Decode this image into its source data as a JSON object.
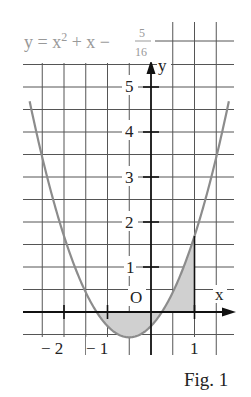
{
  "figure": {
    "equation": {
      "lhs": "y = x",
      "exponent": "2",
      "rhs": " + x −",
      "frac_num": "5",
      "frac_den": "16"
    },
    "caption": "Fig. 1",
    "axis_labels": {
      "x": "x",
      "y": "y",
      "origin": "O"
    },
    "x_ticks": [
      {
        "value": -2,
        "label": "− 2"
      },
      {
        "value": -1,
        "label": "− 1"
      },
      {
        "value": 1,
        "label": "1"
      }
    ],
    "y_ticks": [
      {
        "value": 1,
        "label": "1"
      },
      {
        "value": 2,
        "label": "2"
      },
      {
        "value": 3,
        "label": "3"
      },
      {
        "value": 4,
        "label": "4"
      },
      {
        "value": 5,
        "label": "5"
      }
    ],
    "colors": {
      "curve": "#8c8c8c",
      "grid": "#555555",
      "axis": "#111111",
      "shade": "#d0d0d0",
      "equation_text": "#999999",
      "text": "#222222"
    }
  },
  "chart_data": {
    "type": "line",
    "function": "y = x^2 + x - 5/16",
    "xlabel": "x",
    "ylabel": "y",
    "xlim": [
      -2.9,
      1.9
    ],
    "ylim": [
      -0.5,
      5.5
    ],
    "grid": true,
    "grid_step": 0.5,
    "roots": [
      -1.25,
      0.25
    ],
    "vertex": [
      -0.5,
      -0.5625
    ],
    "shaded_regions": [
      {
        "from_x": -1.25,
        "to_x": 0.25,
        "between": "curve and x-axis (below axis)"
      },
      {
        "from_x": 0.25,
        "to_x": 1,
        "between": "curve and x-axis (above axis)"
      }
    ],
    "x": [
      -2.75,
      -2.5,
      -2,
      -1.5,
      -1.25,
      -1,
      -0.5,
      0,
      0.25,
      0.5,
      1,
      1.5,
      1.75
    ],
    "values": [
      4.5,
      3.4375,
      1.6875,
      0.4375,
      0,
      -0.3125,
      -0.5625,
      -0.3125,
      0,
      0.4375,
      1.6875,
      3.4375,
      4.5
    ]
  }
}
